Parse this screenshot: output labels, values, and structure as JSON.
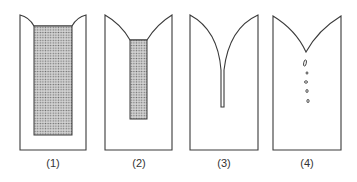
{
  "figure": {
    "panels": [
      {
        "id": 1,
        "label": "(1)",
        "description": "Ingot cross-section with shallow shrinkage at top and large shaded (porous) core region"
      },
      {
        "id": 2,
        "label": "(2)",
        "description": "Ingot cross-section with V-shaped shrinkage cavity and smaller shaded core region"
      },
      {
        "id": 3,
        "label": "(3)",
        "description": "Ingot cross-section with deep narrow pipe shrinkage cavity"
      },
      {
        "id": 4,
        "label": "(4)",
        "description": "Ingot cross-section with V-shaped shrinkage and small isolated voids below"
      }
    ],
    "colors": {
      "stroke": "#3a3a3a",
      "fill": "#ffffff",
      "shading": "#8a8a8a"
    }
  }
}
